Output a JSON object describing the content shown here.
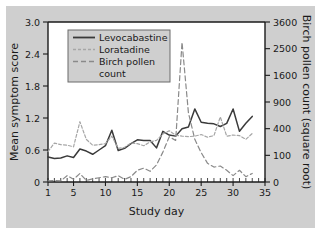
{
  "chart_data": {
    "type": "line",
    "title": "",
    "subtitle": "",
    "xlabel": "Study day",
    "ylabel": "Mean symptom score",
    "y2label": "Birch pollen count (square root)",
    "xlim": [
      1,
      35
    ],
    "ylim": [
      0,
      3.0
    ],
    "y2lim": [
      0,
      3600
    ],
    "grid": false,
    "legend_position": "top-left inside axes",
    "xticks": [
      1,
      5,
      10,
      15,
      20,
      25,
      30,
      35
    ],
    "xtick_labels": [
      "1",
      "5",
      "10",
      "15",
      "20",
      "25",
      "30",
      "35"
    ],
    "xminor_ticks_every": 1,
    "yticks": [
      0,
      0.6,
      1.2,
      1.8,
      2.4,
      3.0
    ],
    "ytick_labels": [
      "0",
      "0.6",
      "1.2",
      "1.8",
      "2.4",
      "3.0"
    ],
    "y2ticks": [
      0,
      100,
      400,
      900,
      1600,
      2500,
      3600
    ],
    "y2tick_labels": [
      "0",
      "100",
      "400",
      "900",
      "1600",
      "2500",
      "3600"
    ],
    "y2_scale_note": "square root scale; right tick k maps to left value 3.0*sqrt(k)/60",
    "x": [
      1,
      2,
      3,
      4,
      5,
      6,
      7,
      8,
      9,
      10,
      11,
      12,
      13,
      14,
      15,
      16,
      17,
      18,
      19,
      20,
      21,
      22,
      23,
      24,
      25,
      26,
      27,
      28,
      29,
      30,
      31,
      32,
      33
    ],
    "series": [
      {
        "name": "Levocabastine",
        "axis": "left",
        "color": "#3a3a3a",
        "style": "solid",
        "values": [
          0.47,
          0.44,
          0.45,
          0.49,
          0.46,
          0.62,
          0.58,
          0.52,
          0.6,
          0.68,
          0.97,
          0.59,
          0.63,
          0.72,
          0.79,
          0.78,
          0.78,
          0.64,
          0.95,
          0.88,
          0.86,
          1.0,
          1.03,
          1.37,
          1.12,
          1.1,
          1.09,
          1.04,
          1.1,
          1.37,
          0.95,
          1.1,
          1.23
        ]
      },
      {
        "name": "Loratadine",
        "axis": "left",
        "color": "#a6a6a6",
        "style": "dashed-fine",
        "values": [
          0.57,
          0.73,
          0.7,
          0.69,
          0.66,
          1.13,
          0.8,
          0.69,
          0.7,
          0.72,
          0.86,
          0.63,
          0.65,
          0.73,
          0.72,
          0.68,
          0.75,
          0.78,
          0.9,
          0.96,
          0.88,
          0.86,
          0.85,
          0.86,
          0.89,
          0.84,
          0.87,
          1.22,
          0.86,
          0.88,
          0.87,
          0.8,
          0.91
        ]
      },
      {
        "name": "Birch pollen count",
        "axis": "right",
        "color": "#8a8a8a",
        "style": "dashed",
        "values_left_scale": [
          0.02,
          0.03,
          0.02,
          0.12,
          0.05,
          0.16,
          0.03,
          0.06,
          0.08,
          0.1,
          0.08,
          0.12,
          0.05,
          0.1,
          0.22,
          0.26,
          0.2,
          0.32,
          0.56,
          0.85,
          0.78,
          2.62,
          1.3,
          0.8,
          0.55,
          0.35,
          0.28,
          0.3,
          0.22,
          0.12,
          0.22,
          0.1,
          0.16
        ],
        "values_pollen_count": [
          0,
          1,
          0,
          6,
          1,
          10,
          0,
          1,
          3,
          4,
          3,
          6,
          1,
          4,
          19,
          27,
          16,
          41,
          125,
          289,
          243,
          2744,
          676,
          256,
          121,
          49,
          31,
          36,
          19,
          6,
          19,
          4,
          10
        ]
      }
    ]
  },
  "legend": {
    "entries": [
      {
        "label": "Levocabastine"
      },
      {
        "label": "Loratadine"
      },
      {
        "label": "Birch pollen"
      },
      {
        "label": "count"
      }
    ]
  },
  "colors": {
    "panel_background": "#cfcfcf",
    "plot_background": "#ffffff",
    "figure_background": "#ffffff",
    "axis": "#1a1a1a",
    "levocabastine": "#3a3a3a",
    "loratadine": "#a6a6a6",
    "birch_pollen": "#8a8a8a",
    "legend_background": "#cfcfcf",
    "legend_border": "#6b6b6b"
  }
}
